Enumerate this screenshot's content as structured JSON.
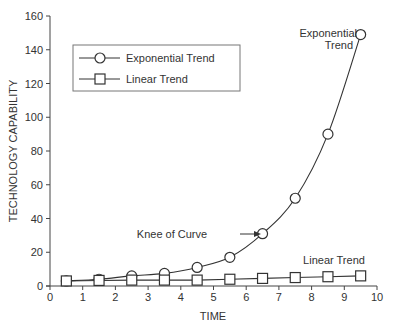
{
  "chart_data": {
    "type": "line",
    "title": "",
    "xlabel": "TIME",
    "ylabel": "TECHNOLOGY CAPABILITY",
    "xlim": [
      0,
      10
    ],
    "ylim": [
      0,
      160
    ],
    "x_ticks": [
      "0",
      "1",
      "2",
      "3",
      "4",
      "5",
      "6",
      "7",
      "8",
      "9",
      "10"
    ],
    "y_ticks": [
      "0",
      "20",
      "40",
      "60",
      "80",
      "100",
      "120",
      "140",
      "160"
    ],
    "grid": false,
    "legend_position": "upper-left",
    "x": [
      0.5,
      1.5,
      2.5,
      3.5,
      4.5,
      5.5,
      6.5,
      7.5,
      8.5,
      9.5
    ],
    "series": [
      {
        "name": "Exponential Trend",
        "marker": "circle",
        "values": [
          3,
          4,
          6,
          7.5,
          11,
          17,
          31,
          52,
          90,
          149
        ]
      },
      {
        "name": "Linear Trend",
        "marker": "square",
        "values": [
          3,
          3.3,
          3.5,
          3.5,
          3.5,
          4,
          4.5,
          5,
          5.5,
          6
        ]
      }
    ],
    "annotations": [
      {
        "text": "Exponential",
        "text2": "Trend",
        "near_series": "Exponential Trend"
      },
      {
        "text": "Knee of Curve",
        "arrow": true,
        "points_to": {
          "x": 6.5,
          "y": 31
        }
      },
      {
        "text": "Linear Trend",
        "near_series": "Linear Trend"
      }
    ]
  },
  "legend": {
    "items": [
      "Exponential Trend",
      "Linear Trend"
    ]
  },
  "labels": {
    "xlabel": "TIME",
    "ylabel": "TECHNOLOGY CAPABILITY",
    "exp_annot_line1": "Exponential",
    "exp_annot_line2": "Trend",
    "knee": "Knee of Curve",
    "linear_annot": "Linear Trend"
  }
}
